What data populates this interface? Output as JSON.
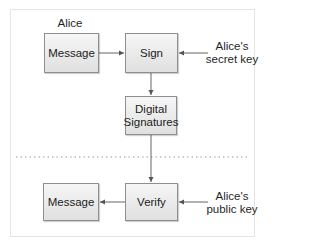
{
  "diagram": {
    "actor": "Alice",
    "nodes": {
      "message_top": "Message",
      "sign": "Sign",
      "digital_signatures_line1": "Digital",
      "digital_signatures_line2": "Signatures",
      "message_bottom": "Message",
      "verify": "Verify"
    },
    "inputs": {
      "secret_key_line1": "Alice's",
      "secret_key_line2": "secret key",
      "public_key_line1": "Alice's",
      "public_key_line2": "public key"
    },
    "edges": [
      {
        "from": "Message",
        "to": "Sign"
      },
      {
        "from": "Alice's secret key",
        "to": "Sign"
      },
      {
        "from": "Sign",
        "to": "Digital Signatures"
      },
      {
        "from": "Digital Signatures",
        "to": "Verify"
      },
      {
        "from": "Alice's public key",
        "to": "Verify"
      },
      {
        "from": "Verify",
        "to": "Message"
      }
    ],
    "separator": "dotted",
    "colors": {
      "box_border": "#8e8e8e",
      "box_fill_top": "#f6f6f6",
      "box_fill_bottom": "#e0e0e0",
      "line": "#555555",
      "separator": "#9a9a9a",
      "frame_border": "#e4e4e4"
    }
  }
}
